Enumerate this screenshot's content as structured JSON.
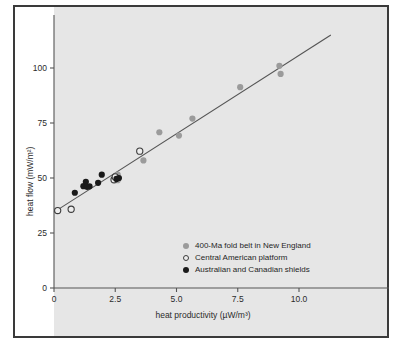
{
  "chart_data": {
    "type": "scatter",
    "title": "",
    "xlabel": "heat productivity (µW/m³)",
    "ylabel": "heat flow (mW/m²)",
    "xlim": [
      0,
      11.8
    ],
    "ylim": [
      0,
      117
    ],
    "xticks": [
      0,
      2.5,
      5.0,
      7.5,
      10.0
    ],
    "xtick_labels": [
      "0",
      "2.5",
      "5.0",
      "7.5",
      "10.0"
    ],
    "yticks": [
      0,
      25,
      50,
      75,
      100
    ],
    "ytick_labels": [
      "0",
      "25",
      "50",
      "75",
      "100"
    ],
    "grid": false,
    "legend_position": "lower-right-inside",
    "series": [
      {
        "name": "400-Ma fold belt in New England",
        "marker": "filled-gray",
        "color": "#9b9b9b",
        "points": [
          {
            "x": 2.45,
            "y": 49.5
          },
          {
            "x": 2.6,
            "y": 51.5
          },
          {
            "x": 2.6,
            "y": 49.0
          },
          {
            "x": 3.65,
            "y": 58.0
          },
          {
            "x": 4.3,
            "y": 70.8
          },
          {
            "x": 5.1,
            "y": 69.3
          },
          {
            "x": 5.65,
            "y": 77.0
          },
          {
            "x": 7.6,
            "y": 91.3
          },
          {
            "x": 9.2,
            "y": 101.0
          },
          {
            "x": 9.25,
            "y": 97.3
          }
        ]
      },
      {
        "name": "Central American platform",
        "marker": "open",
        "color": "#3c3c3c",
        "points": [
          {
            "x": 0.15,
            "y": 35.2
          },
          {
            "x": 0.7,
            "y": 35.8
          },
          {
            "x": 2.45,
            "y": 49.2
          },
          {
            "x": 2.5,
            "y": 50.5
          },
          {
            "x": 3.5,
            "y": 62.2
          }
        ]
      },
      {
        "name": "Australian and Canadian shields",
        "marker": "filled-black",
        "color": "#1a1a1a",
        "points": [
          {
            "x": 0.85,
            "y": 43.3
          },
          {
            "x": 1.2,
            "y": 46.3
          },
          {
            "x": 1.3,
            "y": 48.3
          },
          {
            "x": 1.35,
            "y": 46.0
          },
          {
            "x": 1.45,
            "y": 46.2
          },
          {
            "x": 1.8,
            "y": 47.8
          },
          {
            "x": 1.95,
            "y": 51.5
          },
          {
            "x": 2.55,
            "y": 49.6
          },
          {
            "x": 2.65,
            "y": 50.0
          }
        ]
      }
    ],
    "fit_line": {
      "name": "linear fit",
      "x_start": 0.0,
      "y_start": 34.5,
      "x_end": 11.3,
      "y_end": 115.0,
      "color": "#555555"
    }
  },
  "legend": {
    "items": [
      {
        "label": "400-Ma fold belt in New England",
        "marker": "filled-gray-marker"
      },
      {
        "label": "Central American platform",
        "marker": "open-marker"
      },
      {
        "label": "Australian and Canadian shields",
        "marker": "filled-black-marker"
      }
    ]
  },
  "colors": {
    "panel_background": "#e6e6e6",
    "figure_border": "#3a3a3a",
    "axis": "#555555",
    "text": "#2b2b2b"
  }
}
